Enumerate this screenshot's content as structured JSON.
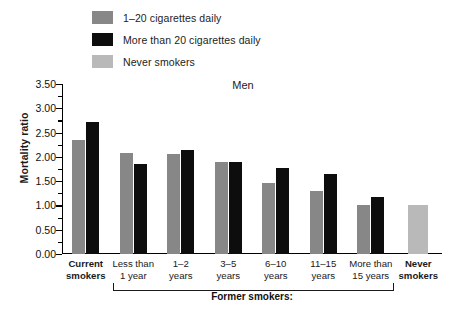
{
  "chart_data": {
    "type": "bar",
    "title": "Men",
    "xlabel": "",
    "ylabel": "Mortality ratio",
    "ylim": [
      0,
      3.5
    ],
    "ytick_step": 0.5,
    "yminor_step": 0.25,
    "grid": false,
    "legend_position": "top-left",
    "ytick_labels": [
      "0.00",
      "0.50",
      "1.00",
      "1.50",
      "2.00",
      "2.50",
      "3.00",
      "3.50"
    ],
    "ytick_values": [
      0,
      0.5,
      1.0,
      1.5,
      2.0,
      2.5,
      3.0,
      3.5
    ],
    "categories": [
      "Current smokers",
      "Less than 1 year",
      "1–2 years",
      "3–5 years",
      "6–10 years",
      "11–15 years",
      "More than 15 years",
      "Never smokers"
    ],
    "category_lines": [
      [
        "Current",
        "smokers"
      ],
      [
        "Less than",
        "1 year"
      ],
      [
        "1–2",
        "years"
      ],
      [
        "3–5",
        "years"
      ],
      [
        "6–10",
        "years"
      ],
      [
        "11–15",
        "years"
      ],
      [
        "More than",
        "15 years"
      ],
      [
        "Never",
        "smokers"
      ]
    ],
    "series": [
      {
        "name": "1–20 cigarettes daily",
        "color": "#878787",
        "values": [
          2.34,
          2.09,
          2.06,
          1.89,
          1.47,
          1.29,
          1.0,
          null
        ]
      },
      {
        "name": "More than 20 cigarettes daily",
        "color": "#0d0d0d",
        "values": [
          2.71,
          1.86,
          2.14,
          1.89,
          1.78,
          1.64,
          1.17,
          null
        ]
      },
      {
        "name": "Never smokers",
        "color": "#b9b9b9",
        "values": [
          null,
          null,
          null,
          null,
          null,
          null,
          null,
          1.0
        ]
      }
    ],
    "annotations": [
      {
        "text": "Former smokers:",
        "spans_categories": [
          "Less than 1 year",
          "More than 15 years"
        ],
        "style": "bracket-below-axis"
      }
    ]
  },
  "legend": {
    "items": [
      {
        "label": "1–20 cigarettes daily",
        "color": "#878787"
      },
      {
        "label": "More than 20 cigarettes daily",
        "color": "#0d0d0d"
      },
      {
        "label": "Never smokers",
        "color": "#b9b9b9"
      }
    ]
  },
  "bracket": {
    "label": "Former smokers:"
  }
}
